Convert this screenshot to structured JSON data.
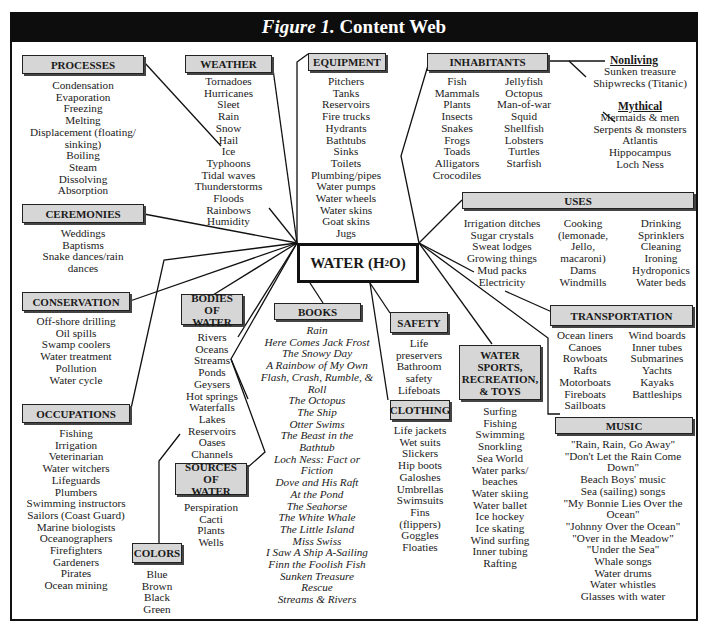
{
  "title": {
    "figure": "Figure 1.",
    "text": "Content Web"
  },
  "center": {
    "prefix": "WATER (H",
    "subscript": "2",
    "suffix": "O)"
  },
  "categories": {
    "processes": {
      "label": "PROCESSES",
      "items": [
        "Condensation",
        "Evaporation",
        "Freezing",
        "Melting",
        "Displacement (floating/",
        "sinking)",
        "Boiling",
        "Steam",
        "Dissolving",
        "Absorption"
      ]
    },
    "weather": {
      "label": "WEATHER",
      "items": [
        "Tornadoes",
        "Hurricanes",
        "Sleet",
        "Rain",
        "Snow",
        "Hail",
        "Ice",
        "Typhoons",
        "Tidal waves",
        "Thunderstorms",
        "Floods",
        "Rainbows",
        "Humidity"
      ]
    },
    "equipment": {
      "label": "EQUIPMENT",
      "items": [
        "Pitchers",
        "Tanks",
        "Reservoirs",
        "Fire trucks",
        "Hydrants",
        "Bathtubs",
        "Sinks",
        "Toilets",
        "Plumbing/pipes",
        "Water pumps",
        "Water wheels",
        "Water skins",
        "Goat skins",
        "Jugs"
      ]
    },
    "inhabitants": {
      "label": "INHABITANTS",
      "col1": [
        "Fish",
        "Mammals",
        "Plants",
        "Insects",
        "Snakes",
        "Frogs",
        "Toads",
        "Alligators",
        "Crocodiles"
      ],
      "col2": [
        "Jellyfish",
        "Octopus",
        "Man-of-war",
        "Squid",
        "Shellfish",
        "Lobsters",
        "Turtles",
        "Starfish"
      ],
      "nonliving": {
        "label": "Nonliving",
        "items": [
          "Sunken treasure",
          "Shipwrecks (Titanic)"
        ]
      },
      "mythical": {
        "label": "Mythical",
        "items": [
          "Mermaids & men",
          "Serpents & monsters",
          "Atlantis",
          "Hippocampus",
          "Loch Ness"
        ]
      }
    },
    "ceremonies": {
      "label": "CEREMONIES",
      "items": [
        "Weddings",
        "Baptisms",
        "Snake dances/rain",
        "dances"
      ]
    },
    "uses": {
      "label": "USES",
      "col1": [
        "Irrigation ditches",
        "Sugar crystals",
        "Sweat lodges",
        "Growing things",
        "Mud packs",
        "Electricity"
      ],
      "col2": [
        "Cooking",
        "(lemonade,",
        "Jello,",
        "macaroni)",
        "Dams",
        "Windmills"
      ],
      "col3": [
        "Drinking",
        "Sprinklers",
        "Cleaning",
        "Ironing",
        "Hydroponics",
        "Water beds"
      ]
    },
    "conservation": {
      "label": "CONSERVATION",
      "items": [
        "Off-shore drilling",
        "Oil spills",
        "Swamp coolers",
        "Water treatment",
        "Pollution",
        "Water cycle"
      ]
    },
    "bodies_of_water": {
      "label_line1": "BODIES OF",
      "label_line2": "WATER",
      "items": [
        "Rivers",
        "Oceans",
        "Streams",
        "Ponds",
        "Geysers",
        "Hot springs",
        "Waterfalls",
        "Lakes",
        "Reservoirs",
        "Oases",
        "Channels"
      ]
    },
    "books": {
      "label": "BOOKS",
      "items": [
        "Rain",
        "Here Comes Jack Frost",
        "The Snowy Day",
        "A Rainbow of My Own",
        "Flash, Crash, Rumble, &",
        "Roll",
        "The Octopus",
        "The Ship",
        "Otter Swims",
        "The Beast in the",
        "Bathtub",
        "Loch Ness: Fact or",
        "Fiction",
        "Dove and His Raft",
        "At the Pond",
        "The Seahorse",
        "The White Whale",
        "The Little Island",
        "Miss Swiss",
        "I Saw A Ship A-Sailing",
        "Finn the Foolish Fish",
        "Sunken Treasure",
        "Rescue",
        "Streams & Rivers"
      ]
    },
    "safety": {
      "label": "SAFETY",
      "items": [
        "Life",
        "preservers",
        "Bathroom",
        "safety",
        "Lifeboats"
      ]
    },
    "clothing": {
      "label": "CLOTHING",
      "items": [
        "Life jackets",
        "Wet suits",
        "Slickers",
        "Hip boots",
        "Galoshes",
        "Umbrellas",
        "Swimsuits",
        "Fins",
        "(flippers)",
        "Goggles",
        "Floaties"
      ]
    },
    "water_sports": {
      "label_lines": [
        "WATER",
        "SPORTS,",
        "RECREATION,",
        "& TOYS"
      ],
      "items": [
        "Surfing",
        "Fishing",
        "Swimming",
        "Snorkling",
        "Sea World",
        "Water parks/",
        "beaches",
        "Water skiing",
        "Water ballet",
        "Ice hockey",
        "Ice skating",
        "Wind surfing",
        "Inner tubing",
        "Rafting"
      ]
    },
    "transportation": {
      "label": "TRANSPORTATION",
      "col1": [
        "Ocean liners",
        "Canoes",
        "Rowboats",
        "Rafts",
        "Motorboats",
        "Fireboats",
        "Sailboats"
      ],
      "col2": [
        "Wind boards",
        "Inner tubes",
        "Submarines",
        "Yachts",
        "Kayaks",
        "Battleships"
      ]
    },
    "music": {
      "label": "MUSIC",
      "items": [
        "\"Rain, Rain, Go Away\"",
        "\"Don't Let the Rain Come",
        "Down\"",
        "Beach Boys' music",
        "Sea (sailing) songs",
        "\"My Bonnie Lies Over the",
        "Ocean\"",
        "\"Johnny Over the Ocean\"",
        "\"Over in the Meadow\"",
        "\"Under the Sea\"",
        "Whale songs",
        "Water drums",
        "Water whistles",
        "Glasses with water"
      ]
    },
    "occupations": {
      "label": "OCCUPATIONS",
      "items": [
        "Fishing",
        "Irrigation",
        "Veterinarian",
        "Water witchers",
        "Lifeguards",
        "Plumbers",
        "Swimming instructors",
        "Sailors (Coast Guard)",
        "Marine biologists",
        "Oceanographers",
        "Firefighters",
        "Gardeners",
        "Pirates",
        "Ocean mining"
      ]
    },
    "sources_of_water": {
      "label_line1": "SOURCES OF",
      "label_line2": "WATER",
      "items": [
        "Perspiration",
        "Cacti",
        "Plants",
        "Wells"
      ]
    },
    "colors": {
      "label": "COLORS",
      "items": [
        "Blue",
        "Brown",
        "Black",
        "Green"
      ]
    }
  },
  "style": {
    "header_fill": "#d6d6d6",
    "title_bar": "#0d0d0d",
    "line": "#111111"
  }
}
